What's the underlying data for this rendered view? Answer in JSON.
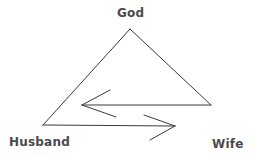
{
  "diagram": {
    "nodes": {
      "top": "God",
      "left": "Husband",
      "right": "Wife"
    },
    "edges": [
      {
        "from": "Husband",
        "to": "God",
        "type": "line"
      },
      {
        "from": "God",
        "to": "Wife",
        "type": "line"
      },
      {
        "from": "Wife",
        "to": "Husband",
        "type": "arrow"
      },
      {
        "from": "Husband",
        "to": "Wife",
        "type": "arrow"
      }
    ],
    "colors": {
      "line": "#3a3a3a",
      "text": "#4a4a4a",
      "background": "#ffffff"
    }
  }
}
